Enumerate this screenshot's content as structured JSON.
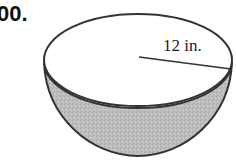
{
  "problem": {
    "number": "00."
  },
  "figure": {
    "shape": "hemisphere",
    "radius_label": "12 in.",
    "colors": {
      "stroke": "#333333",
      "rim_fill": "#ffffff",
      "bowl_fill": "#bdbdbd"
    }
  }
}
